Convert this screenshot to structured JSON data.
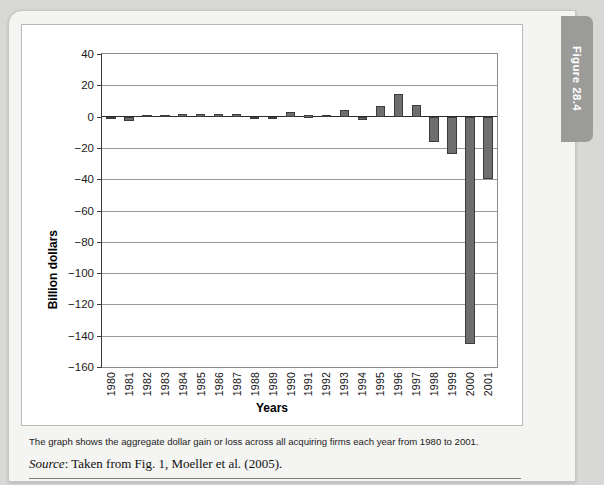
{
  "figure_tab": {
    "label": "Figure 28.4"
  },
  "caption": {
    "note": "The graph shows the aggregate dollar gain or loss across all acquiring firms each year from 1980 to 2001.",
    "source_label": "Source",
    "source_text": ": Taken from Fig. 1, Moeller et al. (2005)."
  },
  "chart_data": {
    "type": "bar",
    "title": "",
    "xlabel": "Years",
    "ylabel": "Billion dollars",
    "ylim": [
      -160,
      40
    ],
    "yticks": [
      40,
      20,
      0,
      -20,
      -40,
      -60,
      -80,
      -100,
      -120,
      -140,
      -160
    ],
    "ytick_labels": [
      "40",
      "20",
      "0",
      "−20",
      "−40",
      "−60",
      "−80",
      "−100",
      "−120",
      "−140",
      "−160"
    ],
    "grid": true,
    "legend": false,
    "bar_color": "#6e6e6e",
    "bar_edge_color": "#3c3c3c",
    "categories": [
      "1980",
      "1981",
      "1982",
      "1983",
      "1984",
      "1985",
      "1986",
      "1987",
      "1988",
      "1989",
      "1990",
      "1991",
      "1992",
      "1993",
      "1994",
      "1995",
      "1996",
      "1997",
      "1998",
      "1999",
      "2000",
      "2001"
    ],
    "values": [
      -1.5,
      -3.0,
      1.0,
      1.2,
      1.5,
      1.5,
      1.6,
      1.8,
      -1.2,
      -0.8,
      2.8,
      0.8,
      1.2,
      4.0,
      -2.0,
      6.5,
      14.5,
      7.5,
      -16.5,
      -24.0,
      -145.0,
      -40.0
    ]
  }
}
